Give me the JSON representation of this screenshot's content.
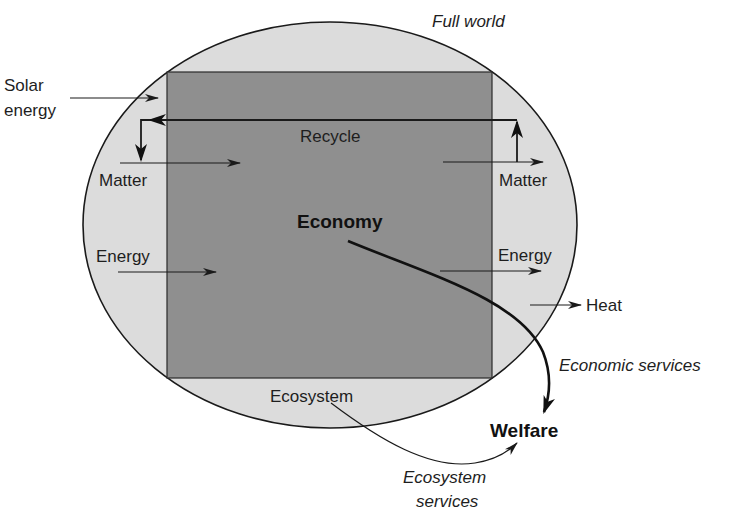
{
  "diagram": {
    "title": "Full world",
    "colors": {
      "background": "#ffffff",
      "ecosystem_fill": "#dcdcdc",
      "economy_fill": "#8f8f8f",
      "stroke": "#1a1a1a"
    },
    "boundary": {
      "label": "Full world",
      "shape": "ellipse"
    },
    "economy": {
      "label": "Economy",
      "shape": "rectangle"
    },
    "ecosystem": {
      "label": "Ecosystem"
    },
    "inputs": {
      "solar": {
        "label_line1": "Solar",
        "label_line2": "energy"
      },
      "matter_in": {
        "label": "Matter"
      },
      "energy_in": {
        "label": "Energy"
      }
    },
    "outputs": {
      "matter_out": {
        "label": "Matter"
      },
      "energy_out": {
        "label": "Energy"
      },
      "heat": {
        "label": "Heat"
      }
    },
    "recycle": {
      "label": "Recycle"
    },
    "welfare": {
      "label": "Welfare"
    },
    "flows": {
      "economic_services": {
        "label": "Economic services"
      },
      "ecosystem_services": {
        "label_line1": "Ecosystem",
        "label_line2": "services"
      }
    }
  }
}
